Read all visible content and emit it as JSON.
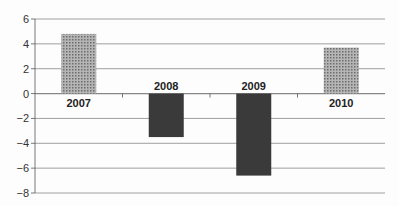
{
  "chart_data": {
    "type": "bar",
    "title": "",
    "xlabel": "",
    "ylabel": "",
    "categories": [
      "2007",
      "2008",
      "2009",
      "2010"
    ],
    "values": [
      4.8,
      -3.5,
      -6.6,
      3.7
    ],
    "ylim": [
      -8,
      6
    ],
    "yticks": [
      6,
      4,
      2,
      0,
      -2,
      -4,
      -6,
      -8
    ],
    "ytick_labels": [
      "6",
      "4",
      "2",
      "0",
      "−2",
      "−4",
      "−6",
      "−8"
    ],
    "grid": true,
    "legend": null,
    "colors": {
      "positive": "#8a8a8a",
      "negative": "#3a3a3a",
      "grid": "#888888"
    }
  }
}
